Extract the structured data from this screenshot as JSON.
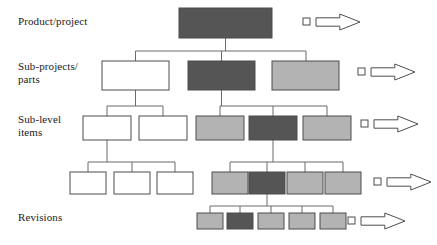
{
  "diagram": {
    "canvas": {
      "width": 437,
      "height": 245
    },
    "colors": {
      "white": "#ffffff",
      "light_gray": "#b3b3b3",
      "dark_gray": "#555555",
      "outline": "#4d4d4d",
      "connector": "#6b6b6b",
      "text": "#1a1a1a"
    },
    "row_labels": [
      {
        "name": "row-label-product",
        "text": "Product/project",
        "x": 18,
        "y": 15
      },
      {
        "name": "row-label-subprojects",
        "text": "Sub-projects/\nparts",
        "x": 18,
        "y": 60
      },
      {
        "name": "row-label-sublevel",
        "text": "Sub-level\nitems",
        "x": 18,
        "y": 113
      },
      {
        "name": "row-label-revisions",
        "text": "Revisions",
        "x": 18,
        "y": 211
      }
    ],
    "rows": [
      {
        "name": "row-product-project",
        "nodes": [
          {
            "name": "node-product-root",
            "x": 179,
            "y": 8,
            "w": 93,
            "h": 30,
            "fill": "#555555"
          }
        ]
      },
      {
        "name": "row-sub-projects",
        "nodes": [
          {
            "name": "node-subproject-1",
            "x": 102,
            "y": 61,
            "w": 67,
            "h": 29,
            "fill": "#ffffff"
          },
          {
            "name": "node-subproject-2",
            "x": 188,
            "y": 61,
            "w": 67,
            "h": 29,
            "fill": "#555555"
          },
          {
            "name": "node-subproject-3",
            "x": 272,
            "y": 61,
            "w": 67,
            "h": 29,
            "fill": "#b3b3b3"
          }
        ]
      },
      {
        "name": "row-sub-level-items",
        "nodes": [
          {
            "name": "node-sublevel-1",
            "x": 83,
            "y": 116,
            "w": 48,
            "h": 24,
            "fill": "#ffffff"
          },
          {
            "name": "node-sublevel-2",
            "x": 139,
            "y": 116,
            "w": 48,
            "h": 24,
            "fill": "#ffffff"
          },
          {
            "name": "node-sublevel-3",
            "x": 196,
            "y": 116,
            "w": 48,
            "h": 24,
            "fill": "#b3b3b3"
          },
          {
            "name": "node-sublevel-4",
            "x": 249,
            "y": 116,
            "w": 48,
            "h": 24,
            "fill": "#555555"
          },
          {
            "name": "node-sublevel-5",
            "x": 303,
            "y": 116,
            "w": 48,
            "h": 24,
            "fill": "#b3b3b3"
          }
        ]
      },
      {
        "name": "row-sub-level-items-2",
        "nodes": [
          {
            "name": "node-sublevel2-1",
            "x": 70,
            "y": 172,
            "w": 36,
            "h": 22,
            "fill": "#ffffff"
          },
          {
            "name": "node-sublevel2-2",
            "x": 114,
            "y": 172,
            "w": 36,
            "h": 22,
            "fill": "#ffffff"
          },
          {
            "name": "node-sublevel2-3",
            "x": 157,
            "y": 172,
            "w": 36,
            "h": 22,
            "fill": "#ffffff"
          },
          {
            "name": "node-sublevel2-4",
            "x": 212,
            "y": 172,
            "w": 36,
            "h": 22,
            "fill": "#b3b3b3"
          },
          {
            "name": "node-sublevel2-5",
            "x": 249,
            "y": 172,
            "w": 36,
            "h": 22,
            "fill": "#555555"
          },
          {
            "name": "node-sublevel2-6",
            "x": 287,
            "y": 172,
            "w": 36,
            "h": 22,
            "fill": "#b3b3b3"
          },
          {
            "name": "node-sublevel2-7",
            "x": 325,
            "y": 172,
            "w": 36,
            "h": 22,
            "fill": "#b3b3b3"
          }
        ]
      },
      {
        "name": "row-revisions",
        "nodes": [
          {
            "name": "node-revision-1",
            "x": 197,
            "y": 213,
            "w": 26,
            "h": 16,
            "fill": "#b3b3b3"
          },
          {
            "name": "node-revision-2",
            "x": 227,
            "y": 213,
            "w": 26,
            "h": 16,
            "fill": "#555555"
          },
          {
            "name": "node-revision-3",
            "x": 258,
            "y": 213,
            "w": 26,
            "h": 16,
            "fill": "#b3b3b3"
          },
          {
            "name": "node-revision-4",
            "x": 289,
            "y": 213,
            "w": 26,
            "h": 16,
            "fill": "#b3b3b3"
          },
          {
            "name": "node-revision-5",
            "x": 320,
            "y": 213,
            "w": 26,
            "h": 16,
            "fill": "#b3b3b3"
          }
        ]
      }
    ],
    "connectors": [
      {
        "name": "connector-root-to-subprojects",
        "d": "M225.5 38 L225.5 51 M135.5 51 L306 51 M135.5 51 L135.5 61 M221.5 51 L221.5 61 M306 51 L306 61"
      },
      {
        "name": "connector-subproject1-to-sublevel",
        "d": "M135.5 90 L135.5 106 M107 106 L163 106 M107 106 L107 116 M163 106 L163 116"
      },
      {
        "name": "connector-subproject2-to-sublevel",
        "d": "M221.5 90 L221.5 106 M220 106 L327 106 M220 106 L220 116 M273 106 L273 116 M327 106 L327 116"
      },
      {
        "name": "connector-sublevel1-to-row4",
        "d": "M107 140 L107 162 M88 162 L175 162 M88 162 L88 172 M132 162 L132 172 M175 162 L175 172"
      },
      {
        "name": "connector-sublevel4-to-row4",
        "d": "M273 140 L273 162 M230 162 L343 162 M230 162 L230 172 M267 162 L267 172 M305 162 L305 172 M343 162 L343 172"
      },
      {
        "name": "connector-row4-to-revisions",
        "d": "M267 194 L267 206 M210 206 L333 206 M210 206 L210 213 M240 206 L240 213 M271 206 L271 213 M302 206 L302 213 M333 206 L333 213"
      }
    ],
    "legend_arrows": [
      {
        "name": "legend-arrow-product",
        "square_x": 303,
        "square_y": 18,
        "square_size": 7,
        "arrow_x": 316,
        "arrow_y": 14,
        "arrow_w": 44,
        "arrow_h": 16
      },
      {
        "name": "legend-arrow-subprojects",
        "square_x": 358,
        "square_y": 68,
        "square_size": 7,
        "arrow_x": 371,
        "arrow_y": 64,
        "arrow_w": 44,
        "arrow_h": 16
      },
      {
        "name": "legend-arrow-sublevel",
        "square_x": 361,
        "square_y": 120,
        "square_size": 7,
        "arrow_x": 374,
        "arrow_y": 116,
        "arrow_w": 44,
        "arrow_h": 16
      },
      {
        "name": "legend-arrow-sublevel2",
        "square_x": 374,
        "square_y": 178,
        "square_size": 7,
        "arrow_x": 387,
        "arrow_y": 174,
        "arrow_w": 44,
        "arrow_h": 16
      },
      {
        "name": "legend-arrow-revisions",
        "square_x": 348,
        "square_y": 217,
        "square_size": 7,
        "arrow_x": 361,
        "arrow_y": 213,
        "arrow_w": 44,
        "arrow_h": 16
      }
    ]
  }
}
